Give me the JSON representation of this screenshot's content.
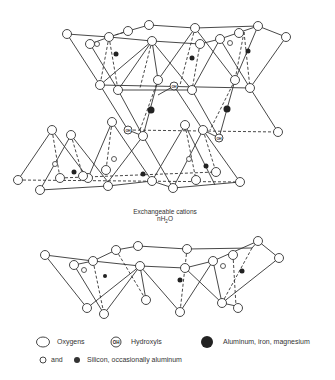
{
  "figure": {
    "type": "crystal-structure-diagram",
    "interlayer_caption": {
      "line1": "Exchangeable cations",
      "line2_prefix": "nH",
      "line2_sub": "2",
      "line2_suffix": "O"
    }
  },
  "legend": {
    "items": [
      {
        "symbol": "open-circle-large",
        "label": "Oxygens"
      },
      {
        "symbol": "oh-circle",
        "symbol_text": "OH",
        "label": "Hydroxyls"
      },
      {
        "symbol": "filled-circle-large",
        "label": "Aluminum, iron, magnesium"
      },
      {
        "symbol": "open-circle-small-and-filled-small",
        "connector": "and",
        "label": "Silicon, occasionally aluminum"
      }
    ]
  },
  "colors": {
    "line": "#333333",
    "fill_dark": "#222222",
    "background": "#ffffff"
  }
}
